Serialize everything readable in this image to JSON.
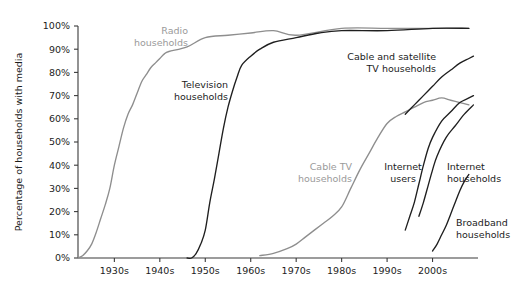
{
  "chart_data": {
    "type": "line",
    "title": "",
    "xlabel": "",
    "ylabel": "Percentage of households with media",
    "ylim": [
      0,
      100
    ],
    "xlim": [
      1922,
      2010
    ],
    "grid": false,
    "legend_position": "inline-labels",
    "x_tick_labels": [
      "1930s",
      "1940s",
      "1950s",
      "1960s",
      "1970s",
      "1980s",
      "1990s",
      "2000s"
    ],
    "x_tick_values": [
      1930,
      1940,
      1950,
      1960,
      1970,
      1980,
      1990,
      2000
    ],
    "y_tick_labels": [
      "0%",
      "10%",
      "20%",
      "30%",
      "40%",
      "50%",
      "60%",
      "70%",
      "80%",
      "90%",
      "100%"
    ],
    "y_tick_values": [
      0,
      10,
      20,
      30,
      40,
      50,
      60,
      70,
      80,
      90,
      100
    ],
    "colors": {
      "dark": "#1f1f1f",
      "gray": "#8e8e8e",
      "axis": "#3a3a3a",
      "background": "#ffffff"
    },
    "series": [
      {
        "name": "Radio households",
        "color": "gray",
        "label": "Radio\nhouseholds",
        "label_line1": "Radio",
        "label_line2": "households",
        "label_x": 188,
        "label_y": 34,
        "label_anchor": "end",
        "x": [
          1922,
          1923,
          1924,
          1925,
          1926,
          1927,
          1928,
          1929,
          1930,
          1931,
          1932,
          1933,
          1934,
          1935,
          1936,
          1937,
          1938,
          1939,
          1940,
          1941,
          1942,
          1946,
          1950,
          1955,
          1960,
          1965,
          1970,
          1980,
          1990,
          2000,
          2008
        ],
        "values": [
          0,
          1,
          3,
          6,
          11,
          17,
          23,
          30,
          40,
          48,
          56,
          62,
          66,
          71,
          76,
          79,
          82,
          84,
          86,
          88,
          89,
          91,
          95,
          96,
          97,
          98,
          96,
          99,
          99,
          99,
          99
        ]
      },
      {
        "name": "Television households",
        "color": "dark",
        "label": "Television\nhouseholds",
        "label_line1": "Television",
        "label_line2": "households",
        "label_x": 228,
        "label_y": 88,
        "label_anchor": "end",
        "x": [
          1946,
          1947,
          1948,
          1949,
          1950,
          1951,
          1952,
          1953,
          1954,
          1955,
          1956,
          1957,
          1958,
          1960,
          1962,
          1965,
          1970,
          1975,
          1980,
          1990,
          2000,
          2008
        ],
        "values": [
          0,
          0,
          2,
          6,
          12,
          24,
          34,
          45,
          56,
          65,
          72,
          78,
          83,
          87,
          90,
          93,
          95,
          97,
          98,
          98,
          99,
          99
        ]
      },
      {
        "name": "Cable TV households",
        "color": "gray",
        "label": "Cable TV\nhouseholds",
        "label_line1": "Cable TV",
        "label_line2": "households",
        "label_x": 352,
        "label_y": 170,
        "label_anchor": "end",
        "x": [
          1962,
          1965,
          1968,
          1970,
          1972,
          1974,
          1976,
          1978,
          1980,
          1982,
          1984,
          1986,
          1988,
          1990,
          1992,
          1994,
          1996,
          1998,
          2000,
          2002,
          2004,
          2006,
          2008
        ],
        "values": [
          1,
          2,
          4,
          6,
          9,
          12,
          15,
          18,
          22,
          30,
          38,
          45,
          52,
          58,
          61,
          63,
          65,
          67,
          68,
          69,
          68,
          67,
          66
        ]
      },
      {
        "name": "Cable and satellite TV households",
        "color": "dark",
        "label": "Cable and satellite\nTV households",
        "label_line1": "Cable and satellite",
        "label_line2": "TV households",
        "label_x": 436,
        "label_y": 60,
        "label_anchor": "end",
        "x": [
          1994,
          1996,
          1998,
          2000,
          2002,
          2004,
          2006,
          2008,
          2009
        ],
        "values": [
          62,
          66,
          70,
          74,
          78,
          81,
          84,
          86,
          87
        ]
      },
      {
        "name": "Internet users",
        "color": "dark",
        "label": "Internet\nusers",
        "label_line1": "Internet",
        "label_line2": "users",
        "label_x": 403,
        "label_y": 170,
        "label_anchor": "middle",
        "x": [
          1994,
          1995,
          1996,
          1997,
          1998,
          1999,
          2000,
          2002,
          2004,
          2006,
          2008,
          2009
        ],
        "values": [
          12,
          18,
          24,
          32,
          40,
          47,
          52,
          59,
          63,
          67,
          69,
          70
        ]
      },
      {
        "name": "Internet households",
        "color": "dark",
        "label": "Internet\nhouseholds",
        "label_line1": "Internet",
        "label_line2": "households",
        "label_x": 447,
        "label_y": 170,
        "label_anchor": "start",
        "x": [
          1997,
          1998,
          1999,
          2000,
          2001,
          2003,
          2005,
          2007,
          2009
        ],
        "values": [
          18,
          24,
          31,
          38,
          44,
          52,
          57,
          62,
          66
        ]
      },
      {
        "name": "Broadband households",
        "color": "dark",
        "label": "Broadband\nhouseholds",
        "label_line1": "Broadband",
        "label_line2": "households",
        "label_x": 456,
        "label_y": 226,
        "label_anchor": "start",
        "x": [
          2000,
          2001,
          2002,
          2003,
          2004,
          2005,
          2006,
          2007,
          2008
        ],
        "values": [
          3,
          6,
          10,
          14,
          19,
          24,
          29,
          33,
          36
        ]
      }
    ]
  }
}
